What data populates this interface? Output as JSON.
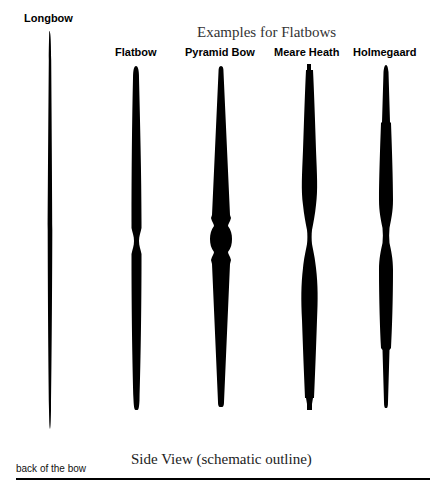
{
  "diagram": {
    "section_title": "Examples for Flatbows",
    "bottom_title": "Side View (schematic outline)",
    "bottom_left_caption": "back of the bow",
    "fill_color": "#000000",
    "background_color": "#ffffff",
    "bows": [
      {
        "id": "longbow",
        "label": "Longbow"
      },
      {
        "id": "flatbow",
        "label": "Flatbow"
      },
      {
        "id": "pyramid-bow",
        "label": "Pyramid Bow"
      },
      {
        "id": "meare-heath",
        "label": "Meare Heath"
      },
      {
        "id": "holmegaard",
        "label": "Holmegaard"
      }
    ]
  }
}
